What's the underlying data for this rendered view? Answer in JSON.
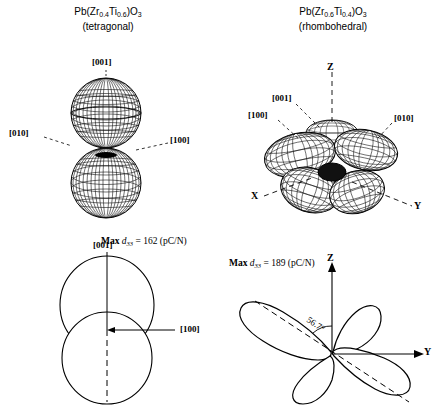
{
  "panels": {
    "top_left": {
      "title_line1_prefix": "Pb(Zr",
      "title_sub1": "0.4",
      "title_mid": "Ti",
      "title_sub2": "0.6",
      "title_suffix": ")O",
      "title_sub3": "3",
      "title_line2": "(tetragonal)",
      "labels": {
        "up": "[001]",
        "left": "[010]",
        "right": "[100]"
      }
    },
    "top_right": {
      "title_line1_prefix": "Pb(Zr",
      "title_sub1": "0.6",
      "title_mid": "Ti",
      "title_sub2": "0.4",
      "title_suffix": ")O",
      "title_sub3": "3",
      "title_line2": "(rhombohedral)",
      "labels": {
        "z": "Z",
        "x": "X",
        "y": "Y",
        "m001": "[001]",
        "m100": "[100]",
        "m010": "[010]"
      }
    },
    "bottom_left": {
      "label_up": "[001]",
      "label_right": "[100]",
      "max_prefix": "Max",
      "max_symbol": "d",
      "max_subscript": "33",
      "max_value": "= 162 (pC/N)"
    },
    "bottom_right": {
      "label_z": "Z",
      "label_y": "Y",
      "angle": "56.7°",
      "max_prefix": "Max",
      "max_symbol": "d",
      "max_subscript": "33",
      "max_value": "= 189 (pC/N)"
    }
  },
  "colors": {
    "ink": "#000000",
    "background": "#ffffff",
    "mesh": "#1a1a1a"
  }
}
